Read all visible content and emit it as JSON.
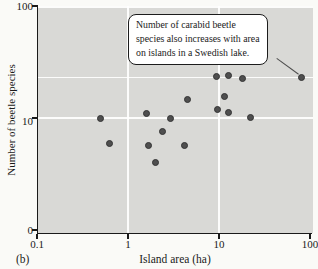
{
  "panel_label": "(b)",
  "colors": {
    "page_background": "#fafaf7",
    "plot_background": "#d9d9d6",
    "dot_fill": "#4f4f4f",
    "dot_edge": "#343434",
    "gridline": "#ffffff",
    "axis": "#1a1a1a",
    "callout_background": "#ffffff",
    "callout_border": "#1c1c1c",
    "leader_line": "#4d4d4d"
  },
  "chart_data": {
    "type": "scatter",
    "title": "",
    "xlabel": "Island area (ha)",
    "ylabel": "Number of beetle species",
    "x_scale": "log",
    "y_scale": "log",
    "xlim": [
      0.1,
      100
    ],
    "x_ticks": [
      "0.1",
      "1",
      "10",
      "100"
    ],
    "y_ticks": [
      "100",
      "10",
      "0"
    ],
    "gridlines": {
      "x": [
        1,
        10
      ],
      "y": [
        100,
        23,
        10
      ]
    },
    "legend": "none",
    "points": [
      {
        "x": 0.5,
        "y": 9.8
      },
      {
        "x": 0.62,
        "y": 5.9
      },
      {
        "x": 1.6,
        "y": 10.9
      },
      {
        "x": 1.7,
        "y": 5.7
      },
      {
        "x": 2.0,
        "y": 4.0
      },
      {
        "x": 2.4,
        "y": 7.5
      },
      {
        "x": 2.9,
        "y": 9.8
      },
      {
        "x": 4.2,
        "y": 5.7
      },
      {
        "x": 4.5,
        "y": 14.6
      },
      {
        "x": 9.5,
        "y": 23.7
      },
      {
        "x": 9.7,
        "y": 12.0
      },
      {
        "x": 11.5,
        "y": 15.6
      },
      {
        "x": 12.6,
        "y": 24.2
      },
      {
        "x": 12.6,
        "y": 11.3
      },
      {
        "x": 18,
        "y": 22.7
      },
      {
        "x": 22,
        "y": 10.2
      },
      {
        "x": 80,
        "y": 23.2
      }
    ],
    "annotation": {
      "line1": "Number of carabid beetle",
      "line2": "species also increases with area",
      "line3": "on islands in a Swedish lake.",
      "target_point": {
        "x": 80,
        "y": 23.2
      }
    }
  }
}
